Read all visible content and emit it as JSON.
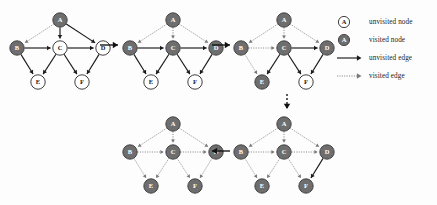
{
  "figure": {
    "background": "#fdfdfd",
    "width": 437,
    "height": 205
  },
  "colors": {
    "visited_node_fill": "#6e6e6e",
    "visited_node_stroke": "#3a3a3a",
    "unvisited_node_fill": "#ffffff",
    "unvisited_node_stroke": "#2a2a2a",
    "visited_node_label": "#ffffff",
    "unvisited_node_label": "#1a1a1a",
    "unvisited_edge": "#1a1a1a",
    "visited_edge": "#7a7a7a",
    "flow_arrow": "#111111",
    "legend_text": "#1a1a1a"
  },
  "legend": {
    "name": "legend",
    "rows": [
      {
        "id": "unvisited-node",
        "symbol": "node-open",
        "label": "unvisited node"
      },
      {
        "id": "visited-node",
        "symbol": "node-filled",
        "label": "visited node"
      },
      {
        "id": "unvisited-edge",
        "symbol": "arrow-solid",
        "label": "unvisited edge"
      },
      {
        "id": "visited-edge",
        "symbol": "arrow-dotted",
        "label": "visited edge"
      }
    ],
    "node_symbol_letter": "A"
  },
  "graph": {
    "node_ids": [
      "A",
      "B",
      "C",
      "D",
      "E",
      "F"
    ],
    "positions": {
      "A": {
        "x": 56,
        "y": 14
      },
      "B": {
        "x": 13,
        "y": 42
      },
      "C": {
        "x": 56,
        "y": 42
      },
      "D": {
        "x": 99,
        "y": 42
      },
      "E": {
        "x": 34,
        "y": 76
      },
      "F": {
        "x": 78,
        "y": 76
      }
    },
    "edges": [
      {
        "from": "A",
        "to": "B"
      },
      {
        "from": "A",
        "to": "C"
      },
      {
        "from": "A",
        "to": "D"
      },
      {
        "from": "B",
        "to": "C"
      },
      {
        "from": "B",
        "to": "E"
      },
      {
        "from": "C",
        "to": "D"
      },
      {
        "from": "C",
        "to": "E"
      },
      {
        "from": "C",
        "to": "F"
      },
      {
        "from": "D",
        "to": "F"
      }
    ]
  },
  "panels": [
    {
      "id": "panel-1",
      "step": 1,
      "left": 4,
      "top": 6,
      "visited_nodes": [
        "A",
        "B"
      ],
      "visited_edges": [
        "A-B"
      ]
    },
    {
      "id": "panel-2",
      "step": 2,
      "left": 117,
      "top": 6,
      "visited_nodes": [
        "A",
        "B",
        "C",
        "D"
      ],
      "visited_edges": [
        "A-B",
        "A-C",
        "A-D"
      ]
    },
    {
      "id": "panel-3",
      "step": 3,
      "left": 228,
      "top": 6,
      "visited_nodes": [
        "A",
        "B",
        "C",
        "D",
        "E"
      ],
      "visited_edges": [
        "A-B",
        "A-C",
        "A-D",
        "B-C",
        "B-E"
      ]
    },
    {
      "id": "panel-4",
      "step": 4,
      "left": 228,
      "top": 110,
      "visited_nodes": [
        "A",
        "B",
        "C",
        "D",
        "E",
        "F"
      ],
      "visited_edges": [
        "A-B",
        "A-C",
        "A-D",
        "B-C",
        "B-E",
        "C-D",
        "C-E",
        "C-F"
      ]
    },
    {
      "id": "panel-5",
      "step": 5,
      "left": 117,
      "top": 110,
      "visited_nodes": [
        "A",
        "B",
        "C",
        "D",
        "E",
        "F"
      ],
      "visited_edges": [
        "A-B",
        "A-C",
        "A-D",
        "B-C",
        "B-E",
        "C-D",
        "C-E",
        "C-F",
        "D-F"
      ]
    }
  ],
  "flow_arrows": [
    {
      "id": "flow-1-to-2",
      "direction": "right",
      "style": "solid",
      "left": 100,
      "top": 40,
      "length": 18
    },
    {
      "id": "flow-2-to-3",
      "direction": "right",
      "style": "solid",
      "left": 212,
      "top": 40,
      "length": 18
    },
    {
      "id": "flow-3-to-4",
      "direction": "down",
      "style": "dashed",
      "left": 282,
      "top": 94,
      "length": 15
    },
    {
      "id": "flow-4-to-5",
      "direction": "left",
      "style": "solid",
      "left": 212,
      "top": 146,
      "length": 18
    }
  ]
}
